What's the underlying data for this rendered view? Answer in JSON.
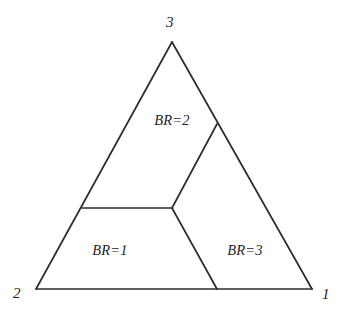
{
  "figure": {
    "type": "simplex-partition-diagram",
    "background_color": "#ffffff",
    "line_color": "#2b2b2b",
    "text_color": "#1f1f1f"
  },
  "triangle": {
    "name": "best-response-simplex",
    "vertices": [
      {
        "id": "v-apex",
        "label": "3",
        "x": 172,
        "y": 42
      },
      {
        "id": "v-bottom-left",
        "label": "2",
        "x": 36,
        "y": 289
      },
      {
        "id": "v-bottom-right",
        "label": "1",
        "x": 312,
        "y": 289
      }
    ],
    "vertex_label_positions": [
      {
        "id": "label-3",
        "label": "3",
        "x": 166,
        "y": 15
      },
      {
        "id": "label-2",
        "label": "2",
        "x": 13,
        "y": 286
      },
      {
        "id": "label-1",
        "label": "1",
        "x": 322,
        "y": 287
      }
    ]
  },
  "partition": {
    "triple_point": {
      "x": 172,
      "y": 208
    },
    "segments": [
      {
        "id": "seg-left-horizontal",
        "name": "segment-to-left-edge",
        "x1": 82,
        "y1": 208,
        "x2": 172,
        "y2": 208
      },
      {
        "id": "seg-upper-right",
        "name": "segment-to-right-edge",
        "x1": 172,
        "y1": 208,
        "x2": 217,
        "y2": 124
      },
      {
        "id": "seg-lower-right",
        "name": "segment-to-bottom-edge",
        "x1": 172,
        "y1": 208,
        "x2": 217,
        "y2": 289
      }
    ]
  },
  "regions": [
    {
      "id": "region-br2",
      "label": "BR=2",
      "x": 172,
      "y": 120
    },
    {
      "id": "region-br1",
      "label": "BR=1",
      "x": 110,
      "y": 250
    },
    {
      "id": "region-br3",
      "label": "BR=3",
      "x": 245,
      "y": 250
    }
  ]
}
